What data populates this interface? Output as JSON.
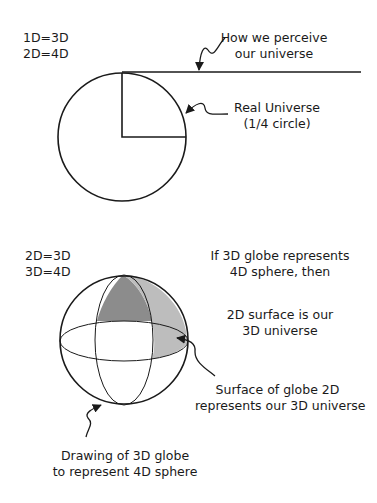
{
  "top": {
    "equations": [
      "1D=3D",
      "2D=4D"
    ],
    "perceive_label": [
      "How we perceive",
      "our universe"
    ],
    "real_label": [
      "Real Universe",
      "(1/4 circle)"
    ]
  },
  "bottom": {
    "equations": [
      "2D=3D",
      "3D=4D"
    ],
    "if_label": [
      "If 3D globe represents",
      "4D sphere, then"
    ],
    "surface_is_label": [
      "2D surface is our",
      "3D universe"
    ],
    "surface_globe_label": [
      "Surface of globe 2D",
      "represents our 3D universe"
    ],
    "drawing_label": [
      "Drawing of 3D globe",
      "to represent 4D sphere"
    ]
  },
  "colors": {
    "stroke": "#1a1a1a",
    "dark_shade": "#8c8c8c",
    "light_shade": "#bdbdbd"
  }
}
